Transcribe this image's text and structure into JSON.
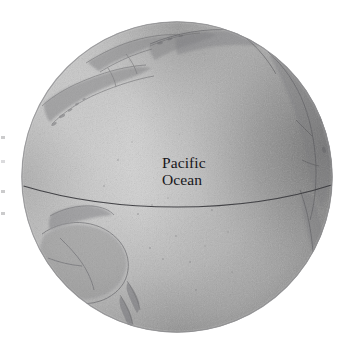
{
  "figure": {
    "kind": "globe-illustration",
    "background_color": "#ffffff",
    "label": {
      "line1": "Pacific",
      "line2": "Ocean",
      "color": "#17161a"
    },
    "globe": {
      "center_x": 177,
      "center_y": 177,
      "radius": 155,
      "ocean_light_color": "#d2d2d2",
      "ocean_mid_color": "#bdbdbd",
      "ocean_dark_color": "#7c7c7c",
      "outline_color": "#8a8a8a",
      "equator_color": "#3b3b3b",
      "land_color": "#8d8d8f"
    },
    "features": [
      {
        "name": "Asia and Kamchatka Peninsula",
        "position": "upper-left limb"
      },
      {
        "name": "Aleutian Islands and Alaska",
        "position": "top"
      },
      {
        "name": "North and Central America",
        "position": "right limb"
      },
      {
        "name": "Australia",
        "position": "lower-left"
      },
      {
        "name": "New Zealand",
        "position": "lower-left"
      },
      {
        "name": "Equator",
        "position": "horizontal curve across globe"
      }
    ],
    "edge_marks": [
      {
        "top": 136
      },
      {
        "top": 160
      },
      {
        "top": 190
      },
      {
        "top": 212
      }
    ]
  }
}
